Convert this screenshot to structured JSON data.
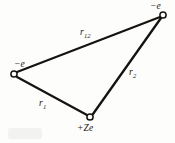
{
  "figure": {
    "background_color": "#fdfdfc",
    "ink_color": "#15120f",
    "width": 175,
    "height": 143
  },
  "particles": [
    {
      "id": "electron-top-right",
      "charge_label": "−e",
      "x": 163,
      "y": 15,
      "marker": "open-circle"
    },
    {
      "id": "electron-left",
      "charge_label": "−e",
      "x": 14,
      "y": 74,
      "marker": "open-circle"
    },
    {
      "id": "nucleus",
      "charge_label": "+Ze",
      "x": 90,
      "y": 117,
      "marker": "open-circle"
    }
  ],
  "edges": [
    {
      "id": "edge-r12",
      "from": "electron-left",
      "to": "electron-top-right",
      "label_base": "r",
      "label_sub": "12",
      "x1": 17,
      "y1": 72,
      "x2": 160,
      "y2": 17
    },
    {
      "id": "edge-r2",
      "from": "electron-top-right",
      "to": "nucleus",
      "label_base": "r",
      "label_sub": "2",
      "x1": 161,
      "y1": 18,
      "x2": 93,
      "y2": 114
    },
    {
      "id": "edge-r1",
      "from": "electron-left",
      "to": "nucleus",
      "label_base": "r",
      "label_sub": "1",
      "x1": 17,
      "y1": 77,
      "x2": 87,
      "y2": 115
    }
  ]
}
